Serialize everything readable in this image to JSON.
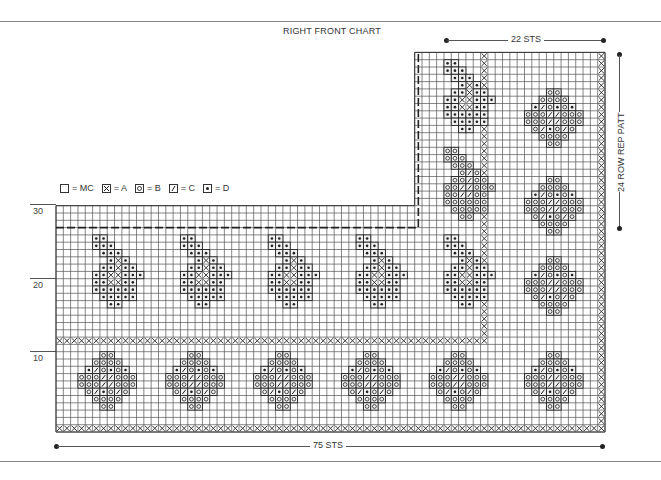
{
  "chart": {
    "title": "RIGHT FRONT CHART",
    "width_label": "75 STS",
    "repeat_width_label": "22 STS",
    "repeat_height_label": "24 ROW REP PATT",
    "row_labels": [
      {
        "row": 10,
        "label": "10"
      },
      {
        "row": 20,
        "label": "20"
      },
      {
        "row": 30,
        "label": "30"
      }
    ],
    "grid": {
      "stitches": 75,
      "rows_lower": 31,
      "rows_upper": 52,
      "upper_start_col": 49
    }
  },
  "legend": [
    {
      "symbol": "blank",
      "label": "= MC"
    },
    {
      "symbol": "x",
      "label": "= A"
    },
    {
      "symbol": "o",
      "label": "= B"
    },
    {
      "symbol": "slash",
      "label": "= C"
    },
    {
      "symbol": "dot",
      "label": "= D"
    }
  ],
  "colors": {
    "ink": "#222222",
    "grid": "#444444",
    "paper": "#ffffff"
  }
}
